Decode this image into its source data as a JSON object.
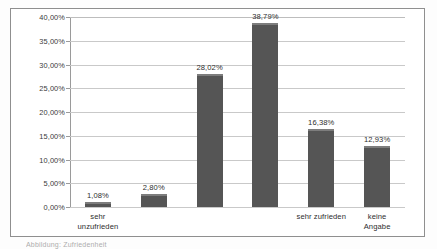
{
  "figure": {
    "caption": "Abbildung: Zufriedenheit"
  },
  "chart_data": {
    "type": "bar",
    "title": "",
    "xlabel": "",
    "ylabel": "",
    "categories": [
      "sehr\nunzufrieden",
      "",
      "",
      "",
      "sehr zufrieden",
      "keine Angabe"
    ],
    "values": [
      1.08,
      2.8,
      28.02,
      38.79,
      16.38,
      12.93
    ],
    "value_labels": [
      "1,08%",
      "2,80%",
      "28,02%",
      "38,79%",
      "16,38%",
      "12,93%"
    ],
    "ylim": [
      0,
      40
    ],
    "ytick_values": [
      0,
      5,
      10,
      15,
      20,
      25,
      30,
      35,
      40
    ],
    "ytick_labels": [
      "0,00%",
      "5,00%",
      "10,00%",
      "15,00%",
      "20,00%",
      "25,00%",
      "30,00%",
      "35,00%",
      "40,00%"
    ],
    "grid": true,
    "legend": "none",
    "bar_color": "#555555",
    "grid_color": "#c9c9c9",
    "axis_color": "#9a9a9a"
  }
}
